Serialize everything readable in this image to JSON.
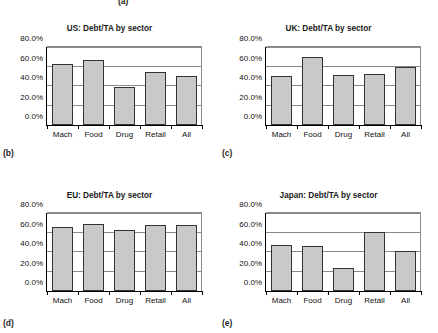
{
  "figure": {
    "cut_off_caption": "(a)",
    "panels": [
      {
        "caption": "(b)",
        "chart_data": {
          "type": "bar",
          "title": "US: Debt/TA by sector",
          "xlabel": "",
          "ylabel": "",
          "categories": [
            "Mach",
            "Food",
            "Drug",
            "Retail",
            "All"
          ],
          "values": [
            62.5,
            66.5,
            39.5,
            54.0,
            50.5
          ],
          "value_unit": "%",
          "ylim": [
            0,
            80
          ],
          "yticks": [
            0,
            20,
            40,
            60,
            80
          ],
          "ytick_labels": [
            "0.0%",
            "20.0%",
            "40.0%",
            "60.0%",
            "80.0%"
          ],
          "grid": true,
          "legend": "none",
          "bar_fill": "#c9c9c9",
          "bar_border": "#333333"
        }
      },
      {
        "caption": "(c)",
        "chart_data": {
          "type": "bar",
          "title": "UK: Debt/TA by sector",
          "xlabel": "",
          "ylabel": "",
          "categories": [
            "Mach",
            "Food",
            "Drug",
            "Retail",
            "All"
          ],
          "values": [
            50.5,
            70.0,
            51.0,
            52.0,
            59.5
          ],
          "value_unit": "%",
          "ylim": [
            0,
            80
          ],
          "yticks": [
            0,
            20,
            40,
            60,
            80
          ],
          "ytick_labels": [
            "0.0%",
            "20.0%",
            "40.0%",
            "60.0%",
            "80.0%"
          ],
          "grid": true,
          "legend": "none",
          "bar_fill": "#c9c9c9",
          "bar_border": "#333333"
        }
      },
      {
        "caption": "(d)",
        "chart_data": {
          "type": "bar",
          "title": "EU: Debt/TA by sector",
          "xlabel": "",
          "ylabel": "",
          "categories": [
            "Mach",
            "Food",
            "Drug",
            "Retail",
            "All"
          ],
          "values": [
            66.0,
            69.0,
            63.0,
            67.5,
            68.0
          ],
          "value_unit": "%",
          "ylim": [
            0,
            80
          ],
          "yticks": [
            0,
            20,
            40,
            60,
            80
          ],
          "ytick_labels": [
            "0.0%",
            "20.0%",
            "40.0%",
            "60.0%",
            "80.0%"
          ],
          "grid": true,
          "legend": "none",
          "bar_fill": "#c9c9c9",
          "bar_border": "#333333"
        }
      },
      {
        "caption": "(e)",
        "chart_data": {
          "type": "bar",
          "title": "Japan: Debt/TA by sector",
          "xlabel": "",
          "ylabel": "",
          "categories": [
            "Mach",
            "Food",
            "Drug",
            "Retail",
            "All"
          ],
          "values": [
            47.0,
            46.5,
            23.5,
            61.0,
            41.5
          ],
          "value_unit": "%",
          "ylim": [
            0,
            80
          ],
          "yticks": [
            0,
            20,
            40,
            60,
            80
          ],
          "ytick_labels": [
            "0.0%",
            "20.0%",
            "40.0%",
            "60.0%",
            "80.0%"
          ],
          "grid": true,
          "legend": "none",
          "bar_fill": "#c9c9c9",
          "bar_border": "#333333"
        }
      }
    ]
  }
}
